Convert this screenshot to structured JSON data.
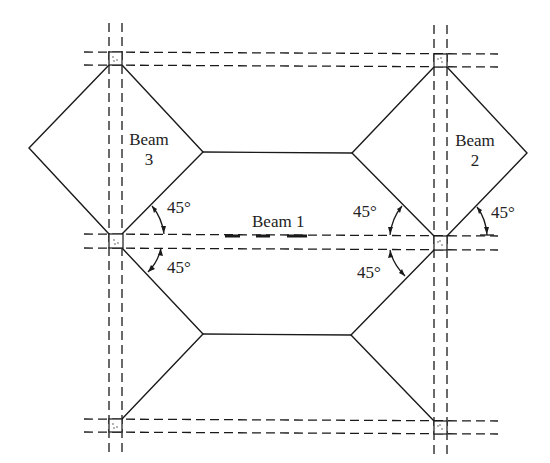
{
  "diagram": {
    "title": "",
    "colors": {
      "stroke": "#1a1a1a",
      "background": "#ffffff"
    },
    "labels": {
      "beam1": "Beam 1",
      "beam2_line1": "Beam",
      "beam2_line2": "2",
      "beam3_line1": "Beam",
      "beam3_line2": "3",
      "angle_top_left": "45°",
      "angle_bottom_left": "45°",
      "angle_top_mid_right": "45°",
      "angle_bottom_mid_right": "45°",
      "angle_far_right": "45°"
    },
    "columns": [
      {
        "id": "col-top-left",
        "x": 109,
        "y": 52
      },
      {
        "id": "col-top-right",
        "x": 434,
        "y": 54
      },
      {
        "id": "col-mid-left",
        "x": 109,
        "y": 234
      },
      {
        "id": "col-mid-right",
        "x": 434,
        "y": 236
      },
      {
        "id": "col-bottom-left",
        "x": 109,
        "y": 419
      },
      {
        "id": "col-bottom-right",
        "x": 434,
        "y": 421
      }
    ],
    "column_size": 13,
    "tributary_area_vertices": {
      "left_diamond_left": [
        29,
        148
      ],
      "left_diamond_right": [
        203,
        152
      ],
      "right_diamond_left": [
        352,
        153
      ],
      "right_diamond_right": [
        527,
        153
      ],
      "lower_hex_left": [
        203,
        334
      ],
      "lower_hex_right": [
        351,
        335
      ]
    },
    "angle_annotation_degrees": 45
  }
}
